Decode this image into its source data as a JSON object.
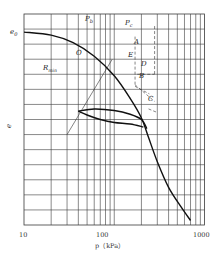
{
  "chart_data": {
    "type": "line",
    "title": "",
    "xlabel": "p（kPa）",
    "ylabel": "e",
    "xscale": "log",
    "xlim": [
      10,
      1000
    ],
    "ylim": [
      0,
      14
    ],
    "x_tick_labels": [
      "10",
      "100",
      "1000"
    ],
    "x_ticks": [
      10,
      100,
      1000
    ],
    "grid": true,
    "y_grid_count": 14,
    "series": [
      {
        "name": "virgin compression curve",
        "points": [
          [
            10,
            12.8
          ],
          [
            20,
            12.6
          ],
          [
            35,
            12.1
          ],
          [
            60,
            11.2
          ],
          [
            100,
            9.9
          ],
          [
            150,
            8.4
          ],
          [
            200,
            7.1
          ],
          [
            240,
            5.8
          ],
          [
            300,
            4.2
          ],
          [
            400,
            2.5
          ],
          [
            550,
            1.2
          ],
          [
            700,
            0.3
          ]
        ]
      },
      {
        "name": "unloading curve",
        "points": [
          [
            210,
            6.5
          ],
          [
            150,
            6.7
          ],
          [
            100,
            6.8
          ],
          [
            70,
            7.0
          ],
          [
            50,
            7.3
          ],
          [
            40,
            7.55
          ]
        ]
      },
      {
        "name": "reloading curve",
        "points": [
          [
            40,
            7.55
          ],
          [
            60,
            7.7
          ],
          [
            100,
            7.6
          ],
          [
            150,
            7.35
          ],
          [
            200,
            7.0
          ],
          [
            230,
            6.4
          ]
        ]
      }
    ],
    "construction_lines": [
      {
        "name": "Rmin tangent line",
        "points": [
          [
            30,
            6.0
          ],
          [
            95,
            11.0
          ]
        ]
      },
      {
        "name": "horizontal line A",
        "points": [
          [
            180,
            10.0
          ],
          [
            280,
            10.0
          ]
        ]
      },
      {
        "name": "tangent line E",
        "points": [
          [
            170,
            9.2
          ],
          [
            245,
            8.7
          ]
        ]
      },
      {
        "name": "bisector line D",
        "points": [
          [
            170,
            9.3
          ],
          [
            280,
            8.2
          ]
        ]
      },
      {
        "name": "Pc vertical",
        "points": [
          [
            280,
            13.2
          ],
          [
            280,
            10.0
          ]
        ]
      },
      {
        "name": "Pb vertical",
        "points": [
          [
            170,
            12.5
          ],
          [
            170,
            9.2
          ]
        ]
      },
      {
        "name": "line B",
        "points": [
          [
            240,
            7.7
          ],
          [
            290,
            7.5
          ]
        ]
      }
    ],
    "annotations": [
      {
        "text": "e₀",
        "at": "y-axis near top"
      },
      {
        "text": "Pₕ",
        "at": "top, left of Pₒ"
      },
      {
        "text": "Pₒ",
        "at": "top right"
      },
      {
        "text": "O",
        "at": "on curve, upper left"
      },
      {
        "text": "A",
        "at": "right of horizontal line"
      },
      {
        "text": "E",
        "at": "near tangent point"
      },
      {
        "text": "D",
        "at": "end of bisector"
      },
      {
        "text": "B",
        "at": "below D"
      },
      {
        "text": "C",
        "at": "on steep part of curve"
      },
      {
        "text": "Rₘᵢₙ",
        "at": "left middle"
      }
    ]
  },
  "labels": {
    "e0": "e",
    "e0_sub": "0",
    "Pb": "P",
    "Pb_sub": "b",
    "Pc": "P",
    "Pc_sub": "c",
    "O": "O",
    "A": "A",
    "E": "E",
    "D": "D",
    "B": "B",
    "C": "C",
    "Rmin": "R",
    "Rmin_sub": "min",
    "ylabel": "e",
    "xlabel": "p（kPa）",
    "tick10": "10",
    "tick100": "100",
    "tick1000": "1000"
  }
}
